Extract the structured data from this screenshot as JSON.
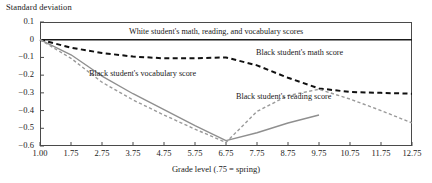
{
  "chart_data": {
    "type": "line",
    "title": "",
    "ylabel": "Standard deviation",
    "xlabel": "Grade level (.75 = spring)",
    "grid": false,
    "legend_position": "inline-annotations",
    "xlim": [
      1.0,
      12.75
    ],
    "ylim": [
      -0.6,
      0.1
    ],
    "ytick_labels": [
      "0.1",
      "0",
      "−0.1",
      "−0.2",
      "−0.3",
      "−0.4",
      "−0.5",
      "−0.6"
    ],
    "ytick_values": [
      0.1,
      0,
      -0.1,
      -0.2,
      -0.3,
      -0.4,
      -0.5,
      -0.6
    ],
    "xtick_labels": [
      "1.00",
      "1.75",
      "2.75",
      "3.75",
      "4.75",
      "5.75",
      "6.75",
      "7.75",
      "8.75",
      "9.75",
      "10.75",
      "11.75",
      "12.75"
    ],
    "x": [
      1.0,
      1.75,
      2.75,
      3.75,
      4.75,
      5.75,
      6.75,
      7.75,
      8.75,
      9.75,
      10.75,
      11.75,
      12.75
    ],
    "series": [
      {
        "name": "White student's math, reading, and vocabulary scores",
        "style": "solid",
        "color": "#1a1a1a",
        "width": 1.6,
        "values": [
          0,
          0,
          0,
          0,
          0,
          0,
          0,
          0,
          0,
          0,
          0,
          0,
          0
        ]
      },
      {
        "name": "Black student's math score",
        "style": "dashed",
        "color": "#111111",
        "width": 2.0,
        "values": [
          0,
          -0.045,
          -0.075,
          -0.095,
          -0.105,
          -0.105,
          -0.1,
          -0.145,
          -0.215,
          -0.275,
          -0.295,
          -0.3,
          -0.305
        ]
      },
      {
        "name": "Black student's vocabulary score",
        "style": "solid",
        "color": "#8f8f8f",
        "width": 1.4,
        "values": [
          0,
          -0.085,
          -0.205,
          -0.305,
          -0.395,
          -0.485,
          -0.57,
          -0.525,
          -0.47,
          -0.425,
          null,
          null,
          null
        ]
      },
      {
        "name": "Black student's reading score",
        "style": "dashed",
        "color": "#9a9a9a",
        "width": 1.4,
        "values": [
          0,
          -0.105,
          -0.24,
          -0.34,
          -0.425,
          -0.505,
          -0.58,
          -0.405,
          -0.315,
          -0.28,
          -0.335,
          -0.4,
          -0.47
        ]
      }
    ],
    "annotations": [
      {
        "text": "White student's math, reading, and vocabulary scores",
        "x_px": 129,
        "y_px": 27
      },
      {
        "text": "Black student's math score",
        "x_px": 256,
        "y_px": 48
      },
      {
        "text": "Black student's vocabulary score",
        "x_px": 89,
        "y_px": 69
      },
      {
        "text": "Black student's reading score",
        "x_px": 236,
        "y_px": 92
      }
    ]
  }
}
